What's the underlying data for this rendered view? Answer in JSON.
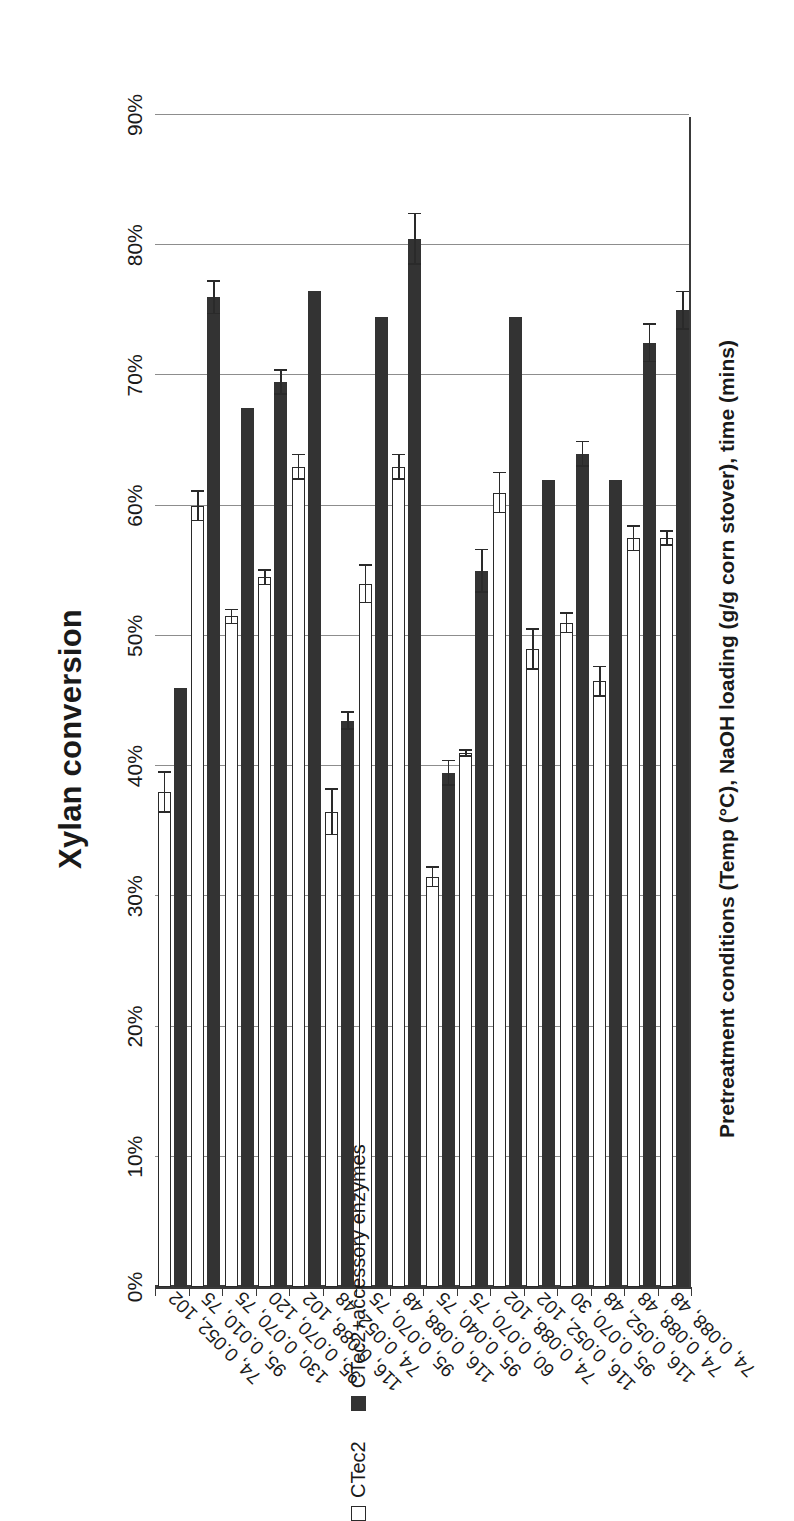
{
  "chart_data": {
    "type": "bar",
    "orientation": "horizontal",
    "title": "Xylan conversion",
    "xlabel": "Xylan conversion",
    "ylabel": "Pretreatment conditions (Temp (°C), NaOH loading (g/g corn stover), time (mins)",
    "xlim": [
      0,
      90
    ],
    "xticks": [
      0,
      10,
      20,
      30,
      40,
      50,
      60,
      70,
      80,
      90
    ],
    "xticklabels": [
      "0%",
      "10%",
      "20%",
      "30%",
      "40%",
      "50%",
      "60%",
      "70%",
      "80%",
      "90%"
    ],
    "grid": true,
    "legend_position": "bottom-left",
    "categories": [
      "74, 0.052, 102",
      "95, 0.010, 75",
      "130, 0.070, 75",
      "95, 0.070, 120",
      "116, 0.088, 102",
      "74, 0.052, 48",
      "95, 0.070, 75",
      "116, 0.088, 48",
      "95, 0.040, 75",
      "60, 0.070, 75",
      "74, 0.088, 102",
      "116, 0.052, 102",
      "95, 0.070, 30",
      "116, 0.052, 48",
      "74, 0.088, 48",
      "74, 0.088, 48"
    ],
    "series": [
      {
        "name": "CTec2",
        "style": "open",
        "values": [
          38.0,
          60.0,
          51.5,
          54.5,
          63.0,
          36.5,
          54.0,
          63.0,
          31.5,
          41.0,
          61.0,
          49.0,
          51.0,
          46.5,
          57.5,
          57.5
        ],
        "errors": [
          1.6,
          1.2,
          0.6,
          0.6,
          1.0,
          1.8,
          1.5,
          1.0,
          0.8,
          0.3,
          1.6,
          1.6,
          0.8,
          1.2,
          1.0,
          0.6
        ]
      },
      {
        "name": "CTec2+accessory enzymes",
        "style": "solid",
        "values": [
          46.0,
          76.0,
          67.5,
          69.5,
          76.5,
          43.5,
          74.5,
          80.5,
          39.5,
          55.0,
          74.5,
          62.0,
          64.0,
          62.0,
          72.5,
          75.0
        ],
        "errors": [
          0.0,
          1.3,
          0.0,
          1.0,
          0.0,
          0.7,
          0.0,
          2.0,
          1.0,
          1.7,
          0.0,
          0.0,
          1.0,
          0.0,
          1.5,
          1.5
        ]
      }
    ]
  },
  "legend": {
    "items": [
      {
        "label": "CTec2",
        "style": "open"
      },
      {
        "label": "CTec2+accessory enzymes",
        "style": "solid"
      }
    ]
  }
}
